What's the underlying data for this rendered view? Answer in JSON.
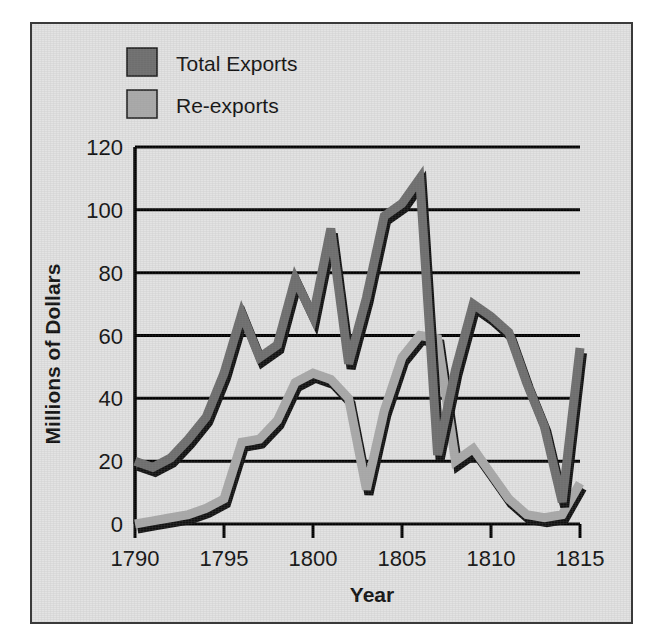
{
  "chart_data": {
    "type": "line",
    "title": "",
    "xlabel": "Year",
    "ylabel": "Millions of Dollars",
    "xlim": [
      1790,
      1815
    ],
    "ylim": [
      0,
      120
    ],
    "xticks": [
      "1790",
      "1795",
      "1800",
      "1805",
      "1810",
      "1815"
    ],
    "yticks": [
      "0",
      "20",
      "40",
      "60",
      "80",
      "100",
      "120"
    ],
    "grid": "horizontal",
    "legend_position": "top-left-outside",
    "x": [
      1790,
      1791,
      1792,
      1793,
      1794,
      1795,
      1796,
      1797,
      1798,
      1799,
      1800,
      1801,
      1802,
      1803,
      1804,
      1805,
      1806,
      1807,
      1808,
      1809,
      1810,
      1811,
      1812,
      1813,
      1814,
      1815
    ],
    "series": [
      {
        "name": "Total Exports",
        "color": "#6e6e6e",
        "values": [
          20,
          18,
          21,
          27,
          34,
          48,
          67,
          53,
          57,
          78,
          66,
          94,
          51,
          72,
          98,
          102,
          110,
          22,
          49,
          70,
          66,
          61,
          45,
          31,
          7,
          56
        ]
      },
      {
        "name": "Re-exports",
        "color": "#aaaaaa",
        "values": [
          0,
          1,
          2,
          3,
          5,
          8,
          26,
          27,
          33,
          45,
          48,
          46,
          40,
          11,
          36,
          53,
          60,
          59,
          20,
          24,
          16,
          8,
          3,
          2,
          3,
          13
        ]
      }
    ]
  },
  "legend": {
    "items": [
      {
        "label": "Total Exports",
        "swatch_color": "#6e6e6e"
      },
      {
        "label": "Re-exports",
        "swatch_color": "#aaaaaa"
      }
    ]
  },
  "axes": {
    "y_axis_title": "Millions of Dollars",
    "x_axis_title": "Year",
    "y_tick_labels": [
      "120",
      "100",
      "80",
      "60",
      "40",
      "20",
      "0"
    ],
    "x_tick_labels": [
      "1790",
      "1795",
      "1800",
      "1805",
      "1810",
      "1815"
    ]
  },
  "colors": {
    "background": "#e3e3e3",
    "frame_border": "#3a3a3a",
    "axis": "#000000",
    "gridline": "#000000",
    "total_exports": "#6e6e6e",
    "re_exports": "#aaaaaa",
    "shadow": "#111111"
  }
}
